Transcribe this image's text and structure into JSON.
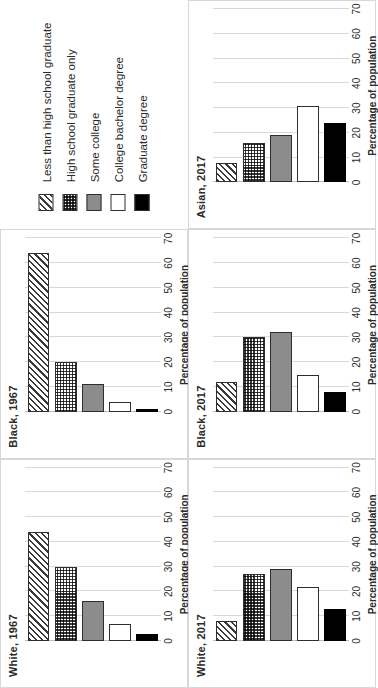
{
  "figure": {
    "axis_title": "Percentage of population",
    "tick_labels": [
      "0",
      "10",
      "20",
      "30",
      "40",
      "50",
      "60",
      "70"
    ],
    "legend": {
      "items": [
        {
          "label": "Less than high school graduate",
          "pattern": "diagonal-hatch",
          "key": "lths"
        },
        {
          "label": "High school graduate only",
          "pattern": "checkerboard",
          "key": "hs"
        },
        {
          "label": "Some college",
          "pattern": "solid-gray",
          "key": "some",
          "color": "#8c8c8c"
        },
        {
          "label": "College bachelor degree",
          "pattern": "solid-white",
          "key": "bach",
          "color": "#ffffff"
        },
        {
          "label": "Graduate degree",
          "pattern": "solid-black",
          "key": "grad",
          "color": "#000000"
        }
      ]
    }
  },
  "chart_data": [
    {
      "type": "bar",
      "title": "White, 1967",
      "xlabel": "Percentage of population",
      "ylabel": "",
      "orientation": "horizontal",
      "xlim": [
        0,
        70
      ],
      "ticks": [
        0,
        10,
        20,
        30,
        40,
        50,
        60,
        70
      ],
      "grid": true,
      "categories": [
        "Less than high school graduate",
        "High school graduate only",
        "Some college",
        "College bachelor degree",
        "Graduate degree"
      ],
      "values": [
        44,
        30,
        16,
        7,
        3
      ]
    },
    {
      "type": "bar",
      "title": "Black, 1967",
      "xlabel": "Percentage of population",
      "ylabel": "",
      "orientation": "horizontal",
      "xlim": [
        0,
        70
      ],
      "ticks": [
        0,
        10,
        20,
        30,
        40,
        50,
        60,
        70
      ],
      "grid": true,
      "categories": [
        "Less than high school graduate",
        "High school graduate only",
        "Some college",
        "College bachelor degree",
        "Graduate degree"
      ],
      "values": [
        64,
        20,
        11,
        4,
        1
      ]
    },
    {
      "type": "legend",
      "title": "",
      "categories": [
        "Less than high school graduate",
        "High school graduate only",
        "Some college",
        "College bachelor degree",
        "Graduate degree"
      ]
    },
    {
      "type": "bar",
      "title": "White, 2017",
      "xlabel": "Percentage of population",
      "ylabel": "",
      "orientation": "horizontal",
      "xlim": [
        0,
        70
      ],
      "ticks": [
        0,
        10,
        20,
        30,
        40,
        50,
        60,
        70
      ],
      "grid": true,
      "categories": [
        "Less than high school graduate",
        "High school graduate only",
        "Some college",
        "College bachelor degree",
        "Graduate degree"
      ],
      "values": [
        8,
        27,
        29,
        22,
        13
      ]
    },
    {
      "type": "bar",
      "title": "Black, 2017",
      "xlabel": "Percentage of population",
      "ylabel": "",
      "orientation": "horizontal",
      "xlim": [
        0,
        70
      ],
      "ticks": [
        0,
        10,
        20,
        30,
        40,
        50,
        60,
        70
      ],
      "grid": true,
      "categories": [
        "Less than high school graduate",
        "High school graduate only",
        "Some college",
        "College bachelor degree",
        "Graduate degree"
      ],
      "values": [
        12,
        30,
        32,
        15,
        8
      ]
    },
    {
      "type": "bar",
      "title": "Asian, 2017",
      "xlabel": "Percentage of population",
      "ylabel": "",
      "orientation": "horizontal",
      "xlim": [
        0,
        70
      ],
      "ticks": [
        0,
        10,
        20,
        30,
        40,
        50,
        60,
        70
      ],
      "grid": true,
      "categories": [
        "Less than high school graduate",
        "High school graduate only",
        "Some college",
        "College bachelor degree",
        "Graduate degree"
      ],
      "values": [
        8,
        16,
        19,
        31,
        24
      ]
    },
    {
      "type": "bar",
      "title": "Hispanic, 2017",
      "xlabel": "Percentage of population",
      "ylabel": "",
      "orientation": "horizontal",
      "xlim": [
        0,
        70
      ],
      "ticks": [
        0,
        10,
        20,
        30,
        40,
        50,
        60,
        70
      ],
      "grid": true,
      "categories": [
        "Less than high school graduate",
        "High school graduate only",
        "Some college",
        "College bachelor degree",
        "Graduate degree"
      ],
      "values": [
        26,
        30,
        22,
        12,
        5
      ]
    }
  ]
}
